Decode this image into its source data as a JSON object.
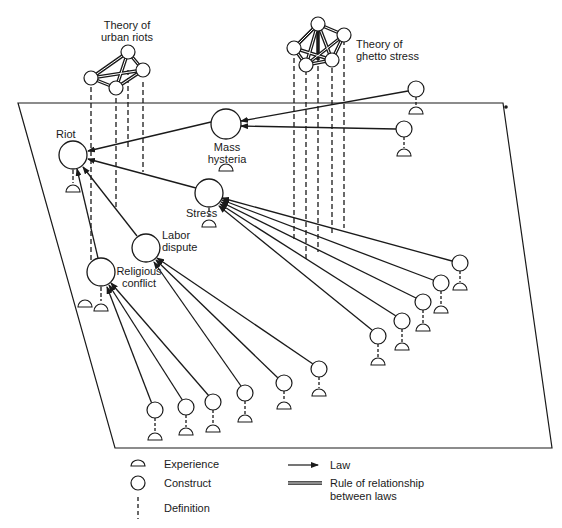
{
  "diagram": {
    "theories": [
      {
        "id": "urban-riots",
        "label_line1": "Theory of",
        "label_line2": "urban riots"
      },
      {
        "id": "ghetto-stress",
        "label_line1": "Theory of",
        "label_line2": "ghetto stress"
      }
    ],
    "constructs": {
      "riot": "Riot",
      "mass_hysteria_1": "Mass",
      "mass_hysteria_2": "hysteria",
      "stress": "Stress",
      "labor_dispute_1": "Labor",
      "labor_dispute_2": "dispute",
      "religious_conflict_1": "Religious",
      "religious_conflict_2": "conflict"
    }
  },
  "legend": {
    "experience": "Experience",
    "construct": "Construct",
    "definition": "Definition",
    "law": "Law",
    "rule_line1": "Rule of relationship",
    "rule_line2": "between laws"
  },
  "colors": {
    "ink": "#1a1a1a",
    "background": "#ffffff"
  }
}
